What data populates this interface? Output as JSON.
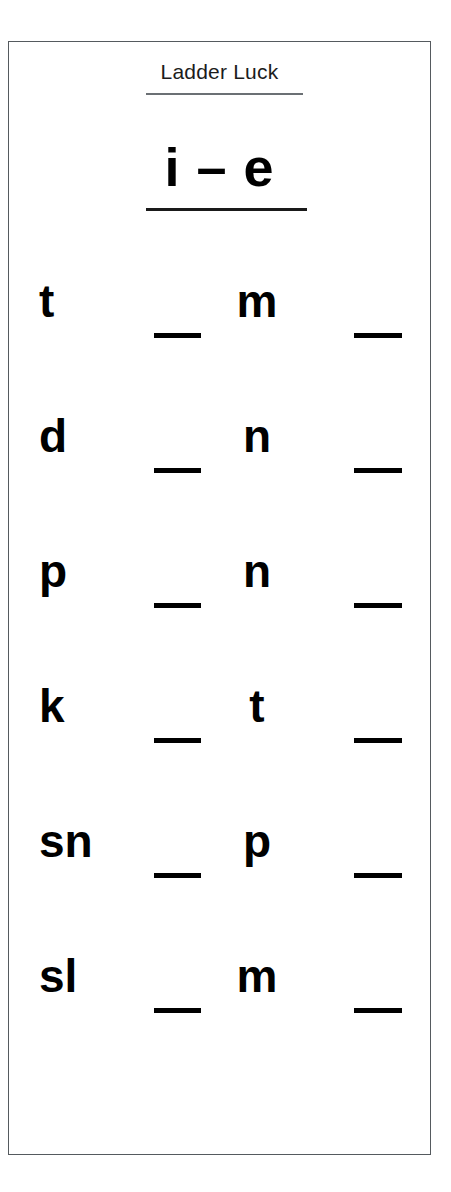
{
  "worksheet": {
    "title": "Ladder Luck",
    "pattern_heading": "i – e",
    "blank_mark": "_",
    "border_color": "#555a5e",
    "text_color": "#000000",
    "background_color": "#ffffff",
    "rows": [
      {
        "onset": "t",
        "blank_1": "_",
        "consonant": "m",
        "blank_2": "_"
      },
      {
        "onset": "d",
        "blank_1": "_",
        "consonant": "n",
        "blank_2": "_"
      },
      {
        "onset": "p",
        "blank_1": "_",
        "consonant": "n",
        "blank_2": "_"
      },
      {
        "onset": "k",
        "blank_1": "_",
        "consonant": "t",
        "blank_2": "_"
      },
      {
        "onset": "sn",
        "blank_1": "_",
        "consonant": "p",
        "blank_2": "_"
      },
      {
        "onset": "sl",
        "blank_1": "_",
        "consonant": "m",
        "blank_2": "_"
      }
    ]
  }
}
